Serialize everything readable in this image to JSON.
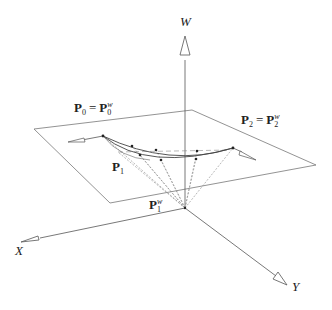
{
  "diagram": {
    "type": "3d-homogeneous-coordinate-figure",
    "axes": {
      "w_label": "W",
      "x_label": "X",
      "y_label": "Y"
    },
    "labels": {
      "p0": {
        "main": "P",
        "sub": "0",
        "eq": "=",
        "main2": "P",
        "sub2": "0",
        "sup2": "w"
      },
      "p2": {
        "main": "P",
        "sub": "2",
        "eq": "=",
        "main2": "P",
        "sub2": "2",
        "sup2": "w"
      },
      "p1": {
        "main": "P",
        "sub": "1"
      },
      "p1w": {
        "main": "P",
        "sub": "1",
        "sup": "w"
      }
    },
    "colors": {
      "line": "#555555",
      "dashed": "#888888",
      "text": "#222222"
    }
  }
}
